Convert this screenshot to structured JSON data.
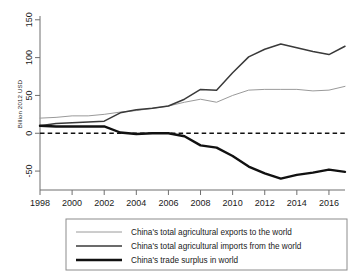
{
  "chart_data": {
    "type": "line",
    "title": "",
    "subtitle": "",
    "xlabel": "",
    "ylabel": "Billion 2012 USD",
    "xlim": [
      1998,
      2017
    ],
    "ylim": [
      -75,
      155
    ],
    "grid": false,
    "legend_position": "bottom",
    "zero_reference_line": true,
    "x": [
      1998,
      1999,
      2000,
      2001,
      2002,
      2003,
      2004,
      2005,
      2006,
      2007,
      2008,
      2009,
      2010,
      2011,
      2012,
      2013,
      2014,
      2015,
      2016,
      2017
    ],
    "xticks": [
      1998,
      2000,
      2002,
      2004,
      2006,
      2008,
      2010,
      2012,
      2014,
      2016
    ],
    "xticklabels": [
      "1998",
      "2000",
      "2002",
      "2004",
      "2006",
      "2008",
      "2010",
      "2012",
      "2014",
      "2016"
    ],
    "yticks": [
      -50,
      0,
      50,
      100,
      150
    ],
    "yticklabels": [
      "-50",
      "0",
      "50",
      "100",
      "150"
    ],
    "series": [
      {
        "name": "China's total agricultural exports to the world",
        "style": "thin-gray",
        "color": "#9a9a9a",
        "values": [
          20,
          21,
          23,
          23,
          25,
          28,
          30,
          33,
          36,
          41,
          45,
          41,
          50,
          57,
          58,
          58,
          58,
          56,
          57,
          62
        ]
      },
      {
        "name": "China's total agricultural imports from the world",
        "style": "medium-dark",
        "color": "#3a3a3a",
        "values": [
          10,
          13,
          14,
          15,
          16,
          27,
          31,
          33,
          36,
          45,
          58,
          57,
          80,
          101,
          111,
          118,
          113,
          108,
          104,
          115
        ]
      },
      {
        "name": "China's trade surplus in world",
        "style": "thick-black",
        "color": "#111111",
        "values": [
          10,
          9,
          9,
          9,
          9,
          1,
          -1,
          0,
          0,
          -4,
          -16,
          -19,
          -30,
          -44,
          -53,
          -60,
          -55,
          -52,
          -48,
          -51
        ]
      }
    ]
  },
  "axes": {
    "y_axis_title": "Billion 2012 USD"
  },
  "legend": {
    "items": [
      {
        "label": "China's total agricultural exports to the world",
        "swatch": "thin-gray-line-icon"
      },
      {
        "label": "China's total agricultural imports from the world",
        "swatch": "medium-dark-line-icon"
      },
      {
        "label": "China's trade surplus in world",
        "swatch": "thick-black-line-icon"
      }
    ]
  }
}
